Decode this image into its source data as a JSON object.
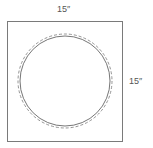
{
  "diagram": {
    "width_label": "15″",
    "height_label": "15″",
    "shapes": {
      "square": {
        "x": 7.5,
        "y": 21.5,
        "width": 115,
        "height": 120,
        "stroke": "#7a7a7a"
      },
      "solid_circle": {
        "cx": 65,
        "cy": 81,
        "r": 45,
        "stroke": "#777777"
      },
      "dashed_circle": {
        "cx": 65,
        "cy": 81,
        "r": 47,
        "stroke": "#888888"
      }
    }
  }
}
